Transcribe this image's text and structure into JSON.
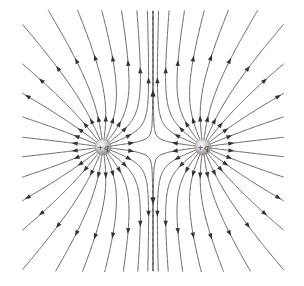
{
  "diagram": {
    "width": 304,
    "height": 286,
    "bounds": {
      "x0": 22,
      "y0": 10,
      "x1": 284,
      "y1": 272
    },
    "line_color": "#555555",
    "arrow_color": "#333333",
    "lines_per_charge": 24,
    "charges": [
      {
        "id": "left",
        "label": "+q",
        "x": 103,
        "y": 147,
        "q": 1
      },
      {
        "id": "right",
        "label": "+q",
        "x": 203,
        "y": 147,
        "q": 1
      }
    ]
  }
}
